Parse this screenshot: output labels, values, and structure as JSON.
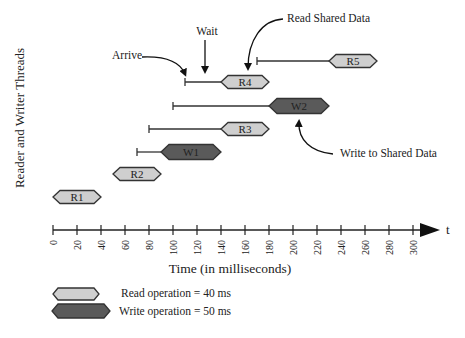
{
  "diagram": {
    "y_axis_label": "Reader and Writer Threads",
    "x_axis_label": "Time (in milliseconds)",
    "axis_end_label": "t",
    "x_ticks": [
      0,
      20,
      40,
      60,
      80,
      100,
      120,
      140,
      160,
      180,
      200,
      220,
      240,
      260,
      280,
      300
    ],
    "colors": {
      "read_fill": "#cfcfcf",
      "write_fill": "#5a5a5a",
      "stroke": "#333333"
    },
    "threads": [
      {
        "name": "R1",
        "type": "read",
        "arrive": 0,
        "start": 0,
        "end": 40
      },
      {
        "name": "R2",
        "type": "read",
        "arrive": 50,
        "start": 50,
        "end": 90
      },
      {
        "name": "W1",
        "type": "write",
        "arrive": 70,
        "start": 90,
        "end": 140
      },
      {
        "name": "R3",
        "type": "read",
        "arrive": 80,
        "start": 140,
        "end": 180
      },
      {
        "name": "W2",
        "type": "write",
        "arrive": 100,
        "start": 180,
        "end": 230
      },
      {
        "name": "R4",
        "type": "read",
        "arrive": 110,
        "start": 140,
        "end": 180
      },
      {
        "name": "R5",
        "type": "read",
        "arrive": 170,
        "start": 230,
        "end": 270
      }
    ],
    "annotations": {
      "arrive": "Arrive",
      "wait": "Wait",
      "read_shared": "Read Shared Data",
      "write_shared": "Write to Shared Data"
    },
    "legend": {
      "read": "Read operation = 40 ms",
      "write": "Write operation = 50 ms"
    }
  }
}
